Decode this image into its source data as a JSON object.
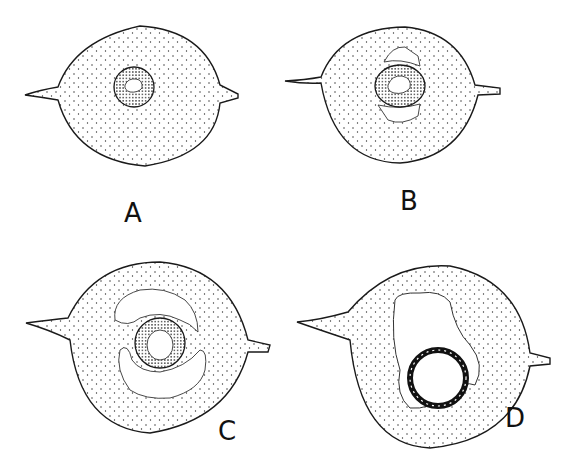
{
  "figure": {
    "panels": [
      {
        "label": "A",
        "label_pos": [
          124,
          200
        ]
      },
      {
        "label": "B",
        "label_pos": [
          400,
          188
        ]
      },
      {
        "label": "C",
        "label_pos": [
          218,
          418
        ]
      },
      {
        "label": "D",
        "label_pos": [
          505,
          405
        ]
      }
    ],
    "colors": {
      "ink": "#1a1a1a",
      "stipple": "#333333",
      "background": "#ffffff"
    }
  }
}
